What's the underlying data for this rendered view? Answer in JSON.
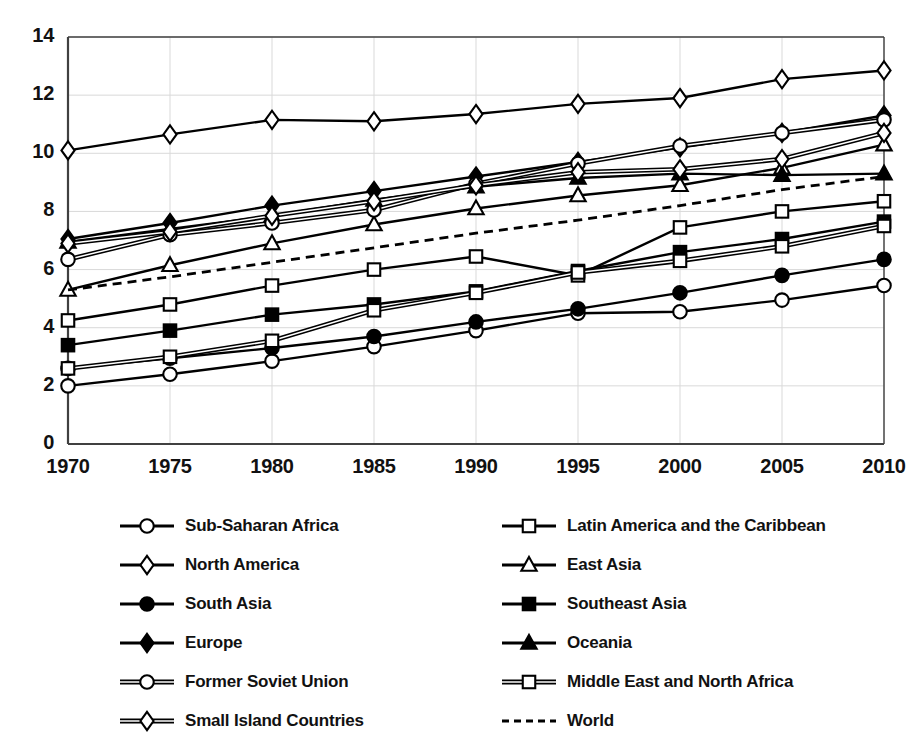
{
  "chart_data": {
    "type": "line",
    "title": "",
    "xlabel": "",
    "ylabel": "",
    "x": [
      1970,
      1975,
      1980,
      1985,
      1990,
      1995,
      2000,
      2005,
      2010
    ],
    "xtick_labels": [
      "1970",
      "1975",
      "1980",
      "1985",
      "1990",
      "1995",
      "2000",
      "2005",
      "2010"
    ],
    "ytick_labels": [
      "0",
      "2",
      "4",
      "6",
      "8",
      "10",
      "12",
      "14"
    ],
    "yticks": [
      0,
      2,
      4,
      6,
      8,
      10,
      12,
      14
    ],
    "ylim": [
      0,
      14
    ],
    "xlim": [
      1970,
      2010
    ],
    "grid": true,
    "legend_position": "bottom",
    "series": [
      {
        "name": "Sub-Saharan Africa",
        "marker": "open-circle",
        "line": "solid",
        "values": [
          2.0,
          2.4,
          2.85,
          3.35,
          3.9,
          4.5,
          4.55,
          4.95,
          5.45
        ]
      },
      {
        "name": "Latin America and the Caribbean",
        "marker": "open-square",
        "line": "solid",
        "values": [
          4.25,
          4.8,
          5.45,
          6.0,
          6.45,
          5.8,
          7.45,
          8.0,
          8.35
        ]
      },
      {
        "name": "North America",
        "marker": "open-diamond",
        "line": "solid",
        "values": [
          10.1,
          10.65,
          11.15,
          11.1,
          11.35,
          11.7,
          11.9,
          12.55,
          12.85
        ]
      },
      {
        "name": "East Asia",
        "marker": "open-triangle",
        "line": "solid",
        "values": [
          5.3,
          6.15,
          6.9,
          7.55,
          8.1,
          8.55,
          8.9,
          9.5,
          10.3
        ]
      },
      {
        "name": "South Asia",
        "marker": "filled-circle",
        "line": "solid",
        "values": [
          2.6,
          2.95,
          3.3,
          3.7,
          4.2,
          4.65,
          5.2,
          5.8,
          6.35
        ]
      },
      {
        "name": "Southeast Asia",
        "marker": "filled-square",
        "line": "solid",
        "values": [
          3.4,
          3.9,
          4.45,
          4.8,
          5.25,
          5.95,
          6.6,
          7.05,
          7.65
        ]
      },
      {
        "name": "Europe",
        "marker": "filled-diamond",
        "line": "solid",
        "values": [
          7.05,
          7.6,
          8.2,
          8.7,
          9.2,
          9.7,
          10.2,
          10.7,
          11.3
        ]
      },
      {
        "name": "Oceania",
        "marker": "filled-triangle",
        "line": "solid",
        "values": [
          6.95,
          7.4,
          7.85,
          8.4,
          8.85,
          9.15,
          9.3,
          9.25,
          9.3
        ]
      },
      {
        "name": "Former Soviet Union",
        "marker": "open-circle",
        "line": "double",
        "values": [
          6.35,
          7.2,
          7.6,
          8.05,
          8.95,
          9.65,
          10.25,
          10.7,
          11.15
        ]
      },
      {
        "name": "Middle East and North Africa",
        "marker": "open-square",
        "line": "double",
        "values": [
          2.6,
          3.0,
          3.55,
          4.6,
          5.2,
          5.9,
          6.3,
          6.8,
          7.5
        ]
      },
      {
        "name": "Small Island Countries",
        "marker": "open-diamond",
        "line": "double",
        "values": [
          6.9,
          7.3,
          7.85,
          8.35,
          8.9,
          9.35,
          9.45,
          9.8,
          10.7
        ]
      },
      {
        "name": "World",
        "marker": "none",
        "line": "dashed",
        "values": [
          5.3,
          5.75,
          6.25,
          6.75,
          7.25,
          7.7,
          8.2,
          8.75,
          9.2
        ]
      }
    ]
  },
  "legend": {
    "column_left": [
      "Sub-Saharan Africa",
      "North America",
      "South Asia",
      "Europe",
      "Former Soviet Union",
      "Small Island Countries"
    ],
    "column_right": [
      "Latin America and the Caribbean",
      "East Asia",
      "Southeast Asia",
      "Oceania",
      "Middle East and North Africa",
      "World"
    ]
  },
  "colors": {
    "line": "#000000",
    "marker_fill_open": "#ffffff",
    "marker_fill_solid": "#000000",
    "grid": "#d9d9d9",
    "axis": "#404040",
    "text": "#111111",
    "background": "#ffffff"
  }
}
